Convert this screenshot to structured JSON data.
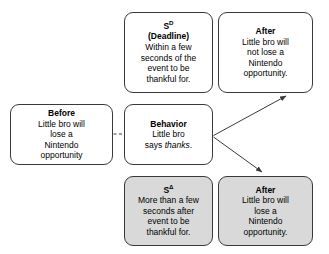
{
  "diagram": {
    "type": "contingency-diagram",
    "colors": {
      "box_border": "#3a3a3a",
      "box_fill": "#ffffff",
      "shaded_fill": "#d9d9d9",
      "line": "#3a3a3a",
      "text": "#000000"
    },
    "boxes": {
      "before": {
        "title": "Before",
        "body": "Little bro will\nlose a\nNintendo\nopportunity",
        "shaded": false
      },
      "sd": {
        "title_base": "S",
        "title_sup": "D",
        "subtitle": "(Deadline)",
        "body": "Within a few\nseconds of the\nevent to be\nthankful for.",
        "shaded": false
      },
      "behavior": {
        "title": "Behavior",
        "body_line1": "Little bro",
        "body_line2_pre": "says ",
        "body_line2_italic": "thanks",
        "body_line2_post": ".",
        "shaded": false
      },
      "s_delta": {
        "title_base": "S",
        "title_sup": "Δ",
        "body": "More than a few\nseconds after\nevent to be\nthankful for.",
        "shaded": true
      },
      "after_top": {
        "title": "After",
        "body": "Little bro will\nnot lose a\nNintendo\nopportunity.",
        "shaded": false
      },
      "after_bottom": {
        "title": "After",
        "body": "Little bro will\nlose a\nNintendo\nopportunity.",
        "shaded": true
      }
    },
    "connectors": {
      "before_to_behavior": {
        "style": "dashed",
        "arrowhead": false
      },
      "behavior_to_after_top": {
        "style": "solid",
        "arrowhead": true
      },
      "behavior_to_after_bottom": {
        "style": "solid",
        "arrowhead": true
      }
    }
  }
}
